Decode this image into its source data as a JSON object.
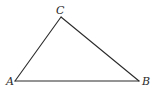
{
  "diagram": {
    "type": "triangle",
    "colors": {
      "stroke": "#2a2a2a",
      "background": "#ffffff"
    },
    "vertices": {
      "A": {
        "label": "A",
        "x": 15,
        "y": 81,
        "label_x": 6,
        "label_y": 85
      },
      "B": {
        "label": "B",
        "x": 139,
        "y": 81,
        "label_x": 142,
        "label_y": 85
      },
      "C": {
        "label": "C",
        "x": 61,
        "y": 17,
        "label_x": 56,
        "label_y": 14
      }
    },
    "edges": [
      {
        "from": "A",
        "to": "B"
      },
      {
        "from": "B",
        "to": "C"
      },
      {
        "from": "C",
        "to": "A"
      }
    ]
  }
}
